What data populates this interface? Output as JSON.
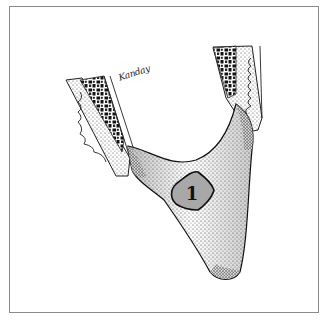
{
  "figure": {
    "signature": "Kanday",
    "region_label": "1",
    "colors": {
      "border": "#8a8a8a",
      "label_fill": "#a8a8a8",
      "stipple": "#333333",
      "background": "#ffffff"
    }
  }
}
